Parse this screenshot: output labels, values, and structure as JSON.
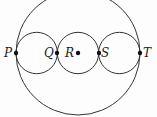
{
  "diagram": {
    "type": "geometry",
    "colors": {
      "stroke": "#333333",
      "point": "#111111",
      "label": "#222222",
      "background": "#fdfdfd"
    },
    "large_circle": {
      "cx": 78,
      "cy": 53,
      "r": 62
    },
    "small_circles": [
      {
        "name": "left",
        "cx": 36.7,
        "cy": 53,
        "r": 20.7
      },
      {
        "name": "middle",
        "cx": 78,
        "cy": 53,
        "r": 20.7
      },
      {
        "name": "right",
        "cx": 119.3,
        "cy": 53,
        "r": 20.7
      }
    ],
    "points": [
      {
        "label": "P",
        "x": 16,
        "y": 53,
        "lx": 4,
        "ly": 57
      },
      {
        "label": "Q",
        "x": 57,
        "y": 53,
        "lx": 44,
        "ly": 57
      },
      {
        "label": "R",
        "x": 78,
        "y": 53,
        "lx": 65,
        "ly": 57
      },
      {
        "label": "S",
        "x": 99,
        "y": 53,
        "lx": 101,
        "ly": 57
      },
      {
        "label": "T",
        "x": 140,
        "y": 53,
        "lx": 143,
        "ly": 57
      }
    ]
  }
}
